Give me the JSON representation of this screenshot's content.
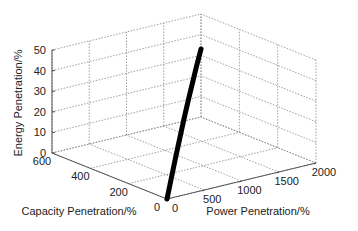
{
  "chart_data": {
    "type": "line",
    "title": "",
    "xlabel": "Power Penetration/%",
    "ylabel": "Capacity Penetration/%",
    "zlabel": "Energy Penetration/%",
    "x_ticks": [
      "0",
      "500",
      "1000",
      "1500",
      "2000"
    ],
    "y_ticks": [
      "0",
      "200",
      "400",
      "600"
    ],
    "z_ticks": [
      "0",
      "10",
      "20",
      "30",
      "40",
      "50"
    ],
    "xlim": [
      0,
      2000
    ],
    "ylim": [
      0,
      600
    ],
    "zlim": [
      0,
      50
    ],
    "grid": true,
    "series": [
      {
        "name": "penetration-curve",
        "points": [
          {
            "power": 0,
            "capacity": 0,
            "energy": 0
          },
          {
            "power": 250,
            "capacity": 75,
            "energy": 5
          },
          {
            "power": 500,
            "capacity": 150,
            "energy": 10
          },
          {
            "power": 750,
            "capacity": 225,
            "energy": 14.5
          },
          {
            "power": 1000,
            "capacity": 300,
            "energy": 19
          },
          {
            "power": 1250,
            "capacity": 375,
            "energy": 23
          },
          {
            "power": 1500,
            "capacity": 450,
            "energy": 26.5
          },
          {
            "power": 1750,
            "capacity": 525,
            "energy": 30
          },
          {
            "power": 2000,
            "capacity": 600,
            "energy": 33
          }
        ]
      }
    ]
  }
}
